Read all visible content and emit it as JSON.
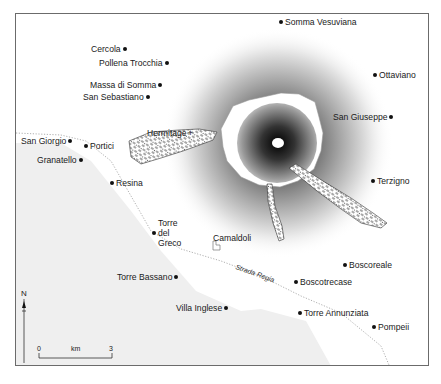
{
  "map": {
    "colors": {
      "sea": "#efefef",
      "land": "#ffffff",
      "frame": "#6b6b6b",
      "road": "#9a9a9a",
      "text": "#1a1a1a"
    },
    "places": [
      {
        "name": "Somma Vesuviana",
        "dot": "left"
      },
      {
        "name": "Cercola",
        "dot": "right"
      },
      {
        "name": "Pollena Trocchia",
        "dot": "right"
      },
      {
        "name": "Ottaviano",
        "dot": "left"
      },
      {
        "name": "Massa di Somma",
        "dot": "right"
      },
      {
        "name": "San Sebastiano",
        "dot": "right"
      },
      {
        "name": "San Giuseppe",
        "dot": "right"
      },
      {
        "name": "San Giorgio",
        "dot": "right"
      },
      {
        "name": "Portici",
        "dot": "left"
      },
      {
        "name": "Granatello",
        "dot": "right"
      },
      {
        "name": "Resina",
        "dot": "left"
      },
      {
        "name": "Terzigno",
        "dot": "left"
      },
      {
        "name": "Torre Bassano",
        "dot": "right"
      },
      {
        "name": "Boscoreale",
        "dot": "left"
      },
      {
        "name": "Boscotrecase",
        "dot": "left"
      },
      {
        "name": "Villa Inglese",
        "dot": "right"
      },
      {
        "name": "Torre Annunziata",
        "dot": "left"
      },
      {
        "name": "Pompeii",
        "dot": "left"
      }
    ],
    "torre_del_greco": [
      "Torre",
      "del",
      "Greco"
    ],
    "hermitage": "Hermitage",
    "camaldoli": "Camaldoli",
    "road": "Strada Regia",
    "north": "N",
    "scale": {
      "min": "0",
      "unit": "km",
      "max": "3"
    }
  }
}
